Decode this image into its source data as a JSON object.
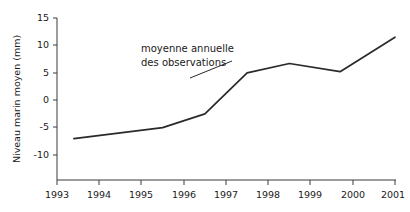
{
  "chart_data": {
    "type": "line",
    "title": "",
    "subtitle": "",
    "xlabel": "",
    "ylabel": "Niveau marin moyen (mm)",
    "xlim": [
      1993,
      2001
    ],
    "ylim": [
      -11,
      15
    ],
    "grid": false,
    "legend": null,
    "x_tick_labels": [
      "1993",
      "1994",
      "1995",
      "1996",
      "1997",
      "1998",
      "1999",
      "2000",
      "2001"
    ],
    "x_ticks": [
      1993,
      1994,
      1995,
      1996,
      1997,
      1998,
      1999,
      2000,
      2001
    ],
    "y_tick_labels": [
      "15",
      "10",
      "5",
      "0",
      "-5",
      "-10"
    ],
    "y_ticks": [
      15,
      10,
      5,
      0,
      -5,
      -10
    ],
    "line_color": "#2a2a2a",
    "annotations": [
      {
        "name": "series-annotation",
        "line1": "moyenne annuelle",
        "line2": "des observations"
      }
    ],
    "series": [
      {
        "name": "moyenne annuelle des observations",
        "color": "#2a2a2a",
        "x": [
          1993.4,
          1995.5,
          1996.5,
          1997.5,
          1998.5,
          1999.7,
          2001.0
        ],
        "values": [
          -7.0,
          -5.0,
          -2.5,
          5.0,
          6.7,
          5.2,
          11.5
        ]
      }
    ]
  }
}
